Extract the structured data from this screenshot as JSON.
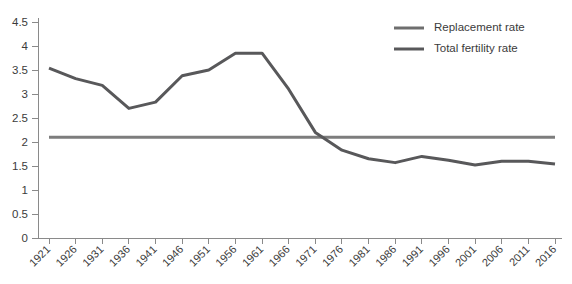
{
  "chart_data": {
    "type": "line",
    "title": "",
    "xlabel": "",
    "ylabel": "",
    "ylim": [
      0,
      4.5
    ],
    "ytick_step": 0.5,
    "grid": false,
    "legend_position": "top-right",
    "categories": [
      "1921",
      "1926",
      "1931",
      "1936",
      "1941",
      "1946",
      "1951",
      "1956",
      "1961",
      "1966",
      "1971",
      "1976",
      "1981",
      "1986",
      "1991",
      "1996",
      "2001",
      "2006",
      "2011",
      "2016"
    ],
    "yticks": [
      "0",
      "0.5",
      "1",
      "1.5",
      "2",
      "2.5",
      "3",
      "3.5",
      "4",
      "4.5"
    ],
    "series": [
      {
        "name": "Replacement rate",
        "color": "#7d7d7d",
        "width": 3,
        "values": [
          2.1,
          2.1,
          2.1,
          2.1,
          2.1,
          2.1,
          2.1,
          2.1,
          2.1,
          2.1,
          2.1,
          2.1,
          2.1,
          2.1,
          2.1,
          2.1,
          2.1,
          2.1,
          2.1,
          2.1
        ]
      },
      {
        "name": "Total fertility rate",
        "color": "#58585a",
        "width": 3,
        "values": [
          3.54,
          3.32,
          3.18,
          2.7,
          2.83,
          3.38,
          3.5,
          3.85,
          3.85,
          3.1,
          2.2,
          1.83,
          1.65,
          1.57,
          1.7,
          1.62,
          1.52,
          1.6,
          1.6,
          1.54
        ]
      }
    ]
  },
  "legend": {
    "items": [
      {
        "label": "Replacement rate",
        "swatch_color": "#6e6e6e"
      },
      {
        "label": "Total fertility rate",
        "swatch_color": "#58585a"
      }
    ]
  },
  "axes": {
    "y_axis_color": "#8a8a8a",
    "x_axis_color": "#8a8a8a"
  }
}
